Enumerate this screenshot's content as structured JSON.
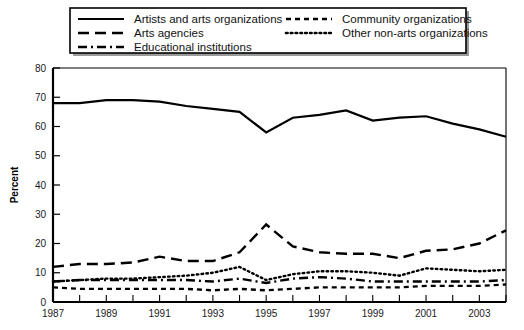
{
  "chart_data": {
    "type": "line",
    "title": "",
    "xlabel": "",
    "ylabel": "Percent",
    "ylim": [
      0,
      80
    ],
    "ytick_step": 10,
    "yticks": [
      "0",
      "10",
      "20",
      "30",
      "40",
      "50",
      "60",
      "70",
      "80"
    ],
    "x": [
      1987,
      1988,
      1989,
      1990,
      1991,
      1992,
      1993,
      1994,
      1995,
      1996,
      1997,
      1998,
      1999,
      2000,
      2001,
      2002,
      2003,
      2004
    ],
    "xticklabels": [
      "1987",
      "1989",
      "1991",
      "1993",
      "1995",
      "1997",
      "1999",
      "2001",
      "2003"
    ],
    "xticklabel_years": [
      1987,
      1989,
      1991,
      1993,
      1995,
      1997,
      1999,
      2001,
      2003
    ],
    "xlim": [
      1987,
      2004
    ],
    "grid": false,
    "legend_position": "top",
    "series": [
      {
        "name": "Artists and arts organizations",
        "style": "solid",
        "values": [
          68,
          68,
          69,
          69,
          68.5,
          67,
          66,
          65,
          58,
          63,
          64,
          65.5,
          62,
          63,
          63.5,
          61,
          59,
          56.5
        ]
      },
      {
        "name": "Arts agencies",
        "style": "dashed",
        "values": [
          12,
          13,
          13,
          13.5,
          15.5,
          14,
          14,
          17,
          26.5,
          19,
          17,
          16.5,
          16.5,
          15,
          17.5,
          18,
          20,
          24.5
        ]
      },
      {
        "name": "Educational institutions",
        "style": "dashdot",
        "values": [
          7,
          7.5,
          7.5,
          7.5,
          7.5,
          7.5,
          7,
          8,
          6.5,
          8,
          8.5,
          8,
          7,
          7,
          7,
          7,
          7,
          7.5
        ]
      },
      {
        "name": "Community organizations",
        "style": "shortdash",
        "values": [
          5,
          4.5,
          4.5,
          4.5,
          4.5,
          4.5,
          4,
          4.5,
          4,
          4.5,
          5,
          5,
          5,
          5,
          5.5,
          5.5,
          5.5,
          6
        ]
      },
      {
        "name": "Other non-arts organizations",
        "style": "dotted",
        "values": [
          7,
          7.5,
          8,
          8,
          8.5,
          9,
          10,
          12,
          7.5,
          9.5,
          10.5,
          10.5,
          10,
          9,
          11.5,
          11,
          10.5,
          11
        ]
      }
    ]
  },
  "legend": {
    "entries": [
      {
        "label": "Artists and arts organizations",
        "style": "solid"
      },
      {
        "label": "Arts agencies",
        "style": "dashed"
      },
      {
        "label": "Educational institutions",
        "style": "dashdot"
      },
      {
        "label": "Community organizations",
        "style": "shortdash"
      },
      {
        "label": "Other non-arts organizations",
        "style": "dotted"
      }
    ]
  },
  "colors": {
    "line": "#000000",
    "axis": "#000000",
    "text": "#111111",
    "background": "#ffffff",
    "legend_border": "#000000",
    "legend_shadow": "#9a9a9a"
  }
}
